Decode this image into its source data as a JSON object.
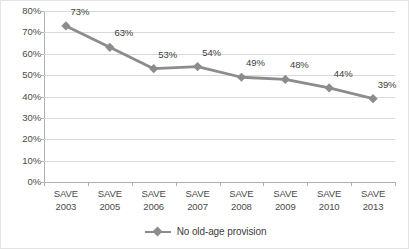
{
  "chart_data": {
    "type": "line",
    "title": "",
    "xlabel": "",
    "ylabel": "",
    "ylim": [
      0,
      80
    ],
    "grid": true,
    "legend_position": "bottom-center",
    "categories": [
      "SAVE 2003",
      "SAVE 2005",
      "SAVE 2006",
      "SAVE 2007",
      "SAVE 2008",
      "SAVE 2009",
      "SAVE 2010",
      "SAVE 2013"
    ],
    "category_lines": [
      {
        "line1": "SAVE",
        "line2": "2003"
      },
      {
        "line1": "SAVE",
        "line2": "2005"
      },
      {
        "line1": "SAVE",
        "line2": "2006"
      },
      {
        "line1": "SAVE",
        "line2": "2007"
      },
      {
        "line1": "SAVE",
        "line2": "2008"
      },
      {
        "line1": "SAVE",
        "line2": "2009"
      },
      {
        "line1": "SAVE",
        "line2": "2010"
      },
      {
        "line1": "SAVE",
        "line2": "2013"
      }
    ],
    "series": [
      {
        "name": "No old-age provision",
        "values": [
          73,
          63,
          53,
          54,
          49,
          48,
          44,
          39
        ],
        "data_labels": [
          "73%",
          "63%",
          "53%",
          "54%",
          "49%",
          "48%",
          "44%",
          "39%"
        ],
        "color": "#8c8c8c",
        "marker": "diamond"
      }
    ],
    "y_ticks": [
      80,
      70,
      60,
      50,
      40,
      30,
      20,
      10,
      0
    ],
    "y_tick_labels": [
      "80%",
      "70%",
      "60%",
      "50%",
      "40%",
      "30%",
      "20%",
      "10%",
      "0%"
    ],
    "colors": {
      "series": "#8c8c8c",
      "gridline": "#d9d9d9",
      "axis": "#b0b0b0",
      "text": "#4a4a4a",
      "label_text": "#3d3d3d",
      "background": "#ffffff",
      "border": "#e3e3e3"
    }
  },
  "legend": {
    "entries": [
      {
        "label": "No old-age provision"
      }
    ]
  }
}
